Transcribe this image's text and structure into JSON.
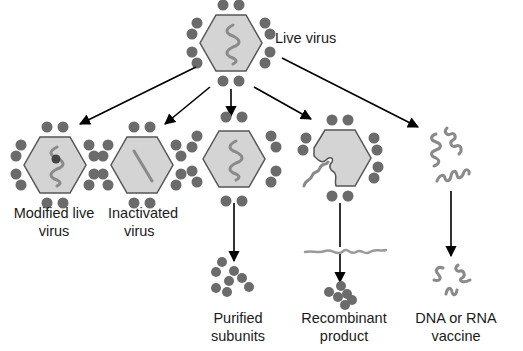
{
  "diagram": {
    "root": {
      "label": "Live virus"
    },
    "branches": [
      {
        "id": "modified-live",
        "label_line1": "Modified live",
        "label_line2": "virus"
      },
      {
        "id": "inactivated",
        "label_line1": "Inactivated",
        "label_line2": "virus"
      },
      {
        "id": "purified-subunits",
        "label_line1": "Purified",
        "label_line2": "subunits"
      },
      {
        "id": "recombinant",
        "label_line1": "Recombinant",
        "label_line2": "product"
      },
      {
        "id": "nucleic-acid",
        "label_line1": "DNA or RNA",
        "label_line2": "vaccine"
      }
    ],
    "colors": {
      "capsid_fill": "#d4d4d4",
      "capsid_stroke": "#555555",
      "protein_dot": "#6b6b6b",
      "nucleic_acid": "#8a8a8a",
      "arrow": "#000000",
      "text": "#1a1a1a"
    }
  }
}
